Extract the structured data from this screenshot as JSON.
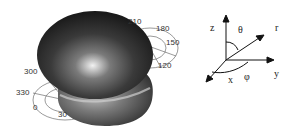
{
  "radiation_pattern": {
    "angle_labels": [
      "210",
      "180",
      "150",
      "120",
      "300",
      "330",
      "0",
      "30"
    ]
  },
  "coordinate_system": {
    "axes": {
      "z": "z",
      "x": "x",
      "y": "y",
      "r": "r"
    },
    "angles": {
      "theta": "θ",
      "phi": "φ"
    }
  }
}
